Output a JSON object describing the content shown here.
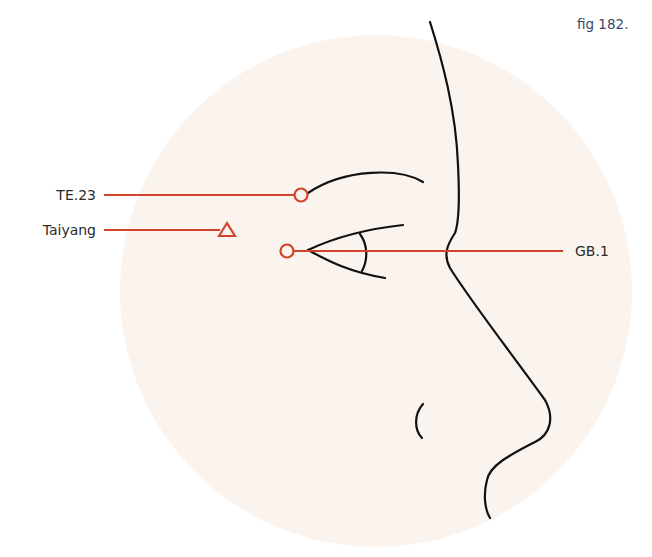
{
  "figure": {
    "caption": "fig 182.",
    "colors": {
      "accent": "#d0452a",
      "background_disc": "#fbf4ee",
      "ink": "#111111",
      "label_text": "#2a2a2a",
      "caption_text": "#3b4a6b"
    }
  },
  "points": [
    {
      "id": "te23",
      "label": "TE.23",
      "marker": "circle",
      "side": "left"
    },
    {
      "id": "taiyang",
      "label": "Taiyang",
      "marker": "triangle",
      "side": "left"
    },
    {
      "id": "gb1",
      "label": "GB.1",
      "marker": "circle",
      "side": "right"
    }
  ]
}
